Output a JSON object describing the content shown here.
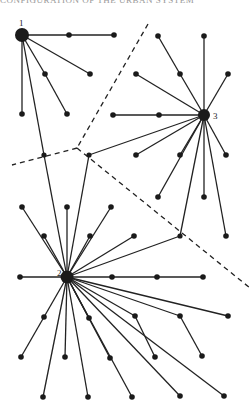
{
  "header": {
    "text": "CONFIGURATION OF THE URBAN SYSTEM"
  },
  "diagram": {
    "type": "central-place network",
    "hubs": [
      {
        "id": "1",
        "label": "1",
        "x": 22,
        "y": 35,
        "r": 7
      },
      {
        "id": "2",
        "label": "2",
        "x": 67,
        "y": 277,
        "r": 6.5
      },
      {
        "id": "3",
        "label": "3",
        "x": 204,
        "y": 115,
        "r": 6
      }
    ],
    "nodes": [
      {
        "id": "a1",
        "x": 69,
        "y": 35
      },
      {
        "id": "a2",
        "x": 114,
        "y": 35
      },
      {
        "id": "a3",
        "x": 90,
        "y": 74
      },
      {
        "id": "a4",
        "x": 45,
        "y": 74
      },
      {
        "id": "a5",
        "x": 67,
        "y": 114
      },
      {
        "id": "a6",
        "x": 22,
        "y": 114
      },
      {
        "id": "j1",
        "x": 44,
        "y": 155
      },
      {
        "id": "b1",
        "x": 158,
        "y": 36
      },
      {
        "id": "b2",
        "x": 204,
        "y": 36
      },
      {
        "id": "b3",
        "x": 180,
        "y": 74
      },
      {
        "id": "b4",
        "x": 136,
        "y": 74
      },
      {
        "id": "b5",
        "x": 228,
        "y": 74
      },
      {
        "id": "b6",
        "x": 159,
        "y": 115
      },
      {
        "id": "b7",
        "x": 113,
        "y": 115
      },
      {
        "id": "b8",
        "x": 136,
        "y": 155
      },
      {
        "id": "b9",
        "x": 180,
        "y": 155
      },
      {
        "id": "b10",
        "x": 226,
        "y": 155
      },
      {
        "id": "b11",
        "x": 158,
        "y": 197
      },
      {
        "id": "b12",
        "x": 204,
        "y": 197
      },
      {
        "id": "b13",
        "x": 226,
        "y": 236
      },
      {
        "id": "j2",
        "x": 89,
        "y": 155
      },
      {
        "id": "j3",
        "x": 180,
        "y": 236
      },
      {
        "id": "c1",
        "x": 22,
        "y": 207
      },
      {
        "id": "c2",
        "x": 67,
        "y": 207
      },
      {
        "id": "c3",
        "x": 111,
        "y": 207
      },
      {
        "id": "c4",
        "x": 44,
        "y": 236
      },
      {
        "id": "c5",
        "x": 90,
        "y": 236
      },
      {
        "id": "c6",
        "x": 134,
        "y": 236
      },
      {
        "id": "c7",
        "x": 20,
        "y": 277
      },
      {
        "id": "c8",
        "x": 112,
        "y": 277
      },
      {
        "id": "c9",
        "x": 157,
        "y": 277
      },
      {
        "id": "c10",
        "x": 203,
        "y": 277
      },
      {
        "id": "c11",
        "x": 44,
        "y": 317
      },
      {
        "id": "c12",
        "x": 89,
        "y": 318
      },
      {
        "id": "c13",
        "x": 135,
        "y": 316
      },
      {
        "id": "c14",
        "x": 180,
        "y": 316
      },
      {
        "id": "c15",
        "x": 228,
        "y": 316
      },
      {
        "id": "c16",
        "x": 21,
        "y": 357
      },
      {
        "id": "c17",
        "x": 65,
        "y": 357
      },
      {
        "id": "c18",
        "x": 110,
        "y": 358
      },
      {
        "id": "c19",
        "x": 155,
        "y": 357
      },
      {
        "id": "c20",
        "x": 202,
        "y": 356
      },
      {
        "id": "c21",
        "x": 43,
        "y": 397
      },
      {
        "id": "c22",
        "x": 88,
        "y": 397
      },
      {
        "id": "c23",
        "x": 132,
        "y": 397
      },
      {
        "id": "c24",
        "x": 180,
        "y": 396
      },
      {
        "id": "c25",
        "x": 224,
        "y": 396
      }
    ],
    "edges": [
      [
        "1",
        "a1"
      ],
      [
        "a1",
        "a2"
      ],
      [
        "1",
        "a3"
      ],
      [
        "1",
        "a4"
      ],
      [
        "a4",
        "a5"
      ],
      [
        "1",
        "a6"
      ],
      [
        "1",
        "j1"
      ],
      [
        "j1",
        "2"
      ],
      [
        "3",
        "b3"
      ],
      [
        "b3",
        "b1"
      ],
      [
        "3",
        "b2"
      ],
      [
        "3",
        "b4"
      ],
      [
        "3",
        "b5"
      ],
      [
        "3",
        "b6"
      ],
      [
        "b6",
        "b7"
      ],
      [
        "3",
        "b8"
      ],
      [
        "3",
        "b9"
      ],
      [
        "3",
        "b10"
      ],
      [
        "3",
        "b11"
      ],
      [
        "3",
        "b12"
      ],
      [
        "3",
        "j3"
      ],
      [
        "3",
        "b13"
      ],
      [
        "3",
        "j2"
      ],
      [
        "j2",
        "2"
      ],
      [
        "j3",
        "2"
      ],
      [
        "2",
        "c1"
      ],
      [
        "2",
        "c2"
      ],
      [
        "2",
        "c3"
      ],
      [
        "2",
        "c4"
      ],
      [
        "2",
        "c5"
      ],
      [
        "2",
        "c6"
      ],
      [
        "2",
        "c7"
      ],
      [
        "2",
        "c8"
      ],
      [
        "c8",
        "c9"
      ],
      [
        "c9",
        "c10"
      ],
      [
        "2",
        "c11"
      ],
      [
        "2",
        "c12"
      ],
      [
        "2",
        "c13"
      ],
      [
        "2",
        "c14"
      ],
      [
        "2",
        "c15"
      ],
      [
        "c11",
        "c16"
      ],
      [
        "2",
        "c17"
      ],
      [
        "2",
        "c18"
      ],
      [
        "c13",
        "c19"
      ],
      [
        "c14",
        "c20"
      ],
      [
        "2",
        "c21"
      ],
      [
        "2",
        "c22"
      ],
      [
        "2",
        "c23"
      ],
      [
        "2",
        "c24"
      ],
      [
        "2",
        "c25"
      ]
    ],
    "boundaries": [
      {
        "name": "boundary-1-3",
        "points": [
          [
            148,
            24
          ],
          [
            77,
            148
          ]
        ]
      },
      {
        "name": "boundary-1-2",
        "points": [
          [
            77,
            148
          ],
          [
            12,
            165
          ]
        ]
      },
      {
        "name": "boundary-2-3",
        "points": [
          [
            77,
            148
          ],
          [
            250,
            288
          ]
        ]
      }
    ]
  }
}
